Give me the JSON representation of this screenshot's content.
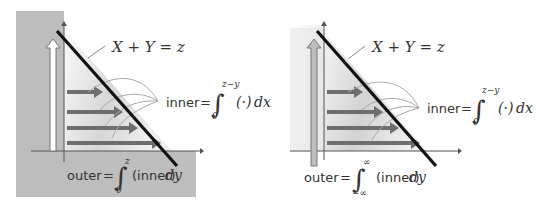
{
  "figure": {
    "panels": [
      {
        "id": "left",
        "line_label": "X + Y = z",
        "inner": {
          "lhs": "inner",
          "eq": "=",
          "lower": "0",
          "upper": "z−y",
          "integrand": "(·)",
          "differential": "dx"
        },
        "outer": {
          "lhs": "outer",
          "eq": "=",
          "lower": "0",
          "upper": "z",
          "integrand": "(inner)",
          "differential": "dy"
        },
        "shading": "outside-first-quadrant-gray",
        "outer_arrow_style": "hollow"
      },
      {
        "id": "right",
        "line_label": "X + Y = z",
        "inner": {
          "lhs": "inner",
          "eq": "=",
          "lower": "0",
          "upper": "z−y",
          "integrand": "(·)",
          "differential": "dx"
        },
        "outer": {
          "lhs": "outer",
          "eq": "=",
          "lower": "−∞",
          "upper": "∞",
          "integrand": "(inner)",
          "differential": "dy"
        },
        "shading": "none",
        "outer_arrow_style": "filled-gray"
      }
    ],
    "colors": {
      "background": "#ffffff",
      "outside_region": "#bdbdbd",
      "triangle_light": "#f2f2f2",
      "triangle_dark": "#c9c9c9",
      "arrow": "#6e6e6e",
      "boundary_line": "#111111",
      "axes": "#555555",
      "leader_lines": "#a8a8a8",
      "text": "#333333"
    }
  }
}
